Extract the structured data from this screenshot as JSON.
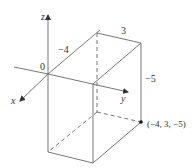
{
  "figure": {
    "type": "3d-box-in-coordinate-axes",
    "axes": {
      "x_label": "x",
      "y_label": "y",
      "z_label": "z",
      "origin_label": "0"
    },
    "dimension_labels": {
      "x_extent": "−4",
      "y_extent": "3",
      "z_extent": "−5"
    },
    "point_label": "(−4, 3, −5)",
    "colors": {
      "line": "#555555",
      "text": "#333333",
      "point": "#111111"
    }
  }
}
